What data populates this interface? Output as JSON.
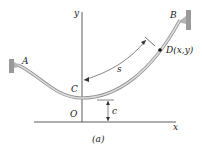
{
  "figure": {
    "caption": "(a)",
    "labels": {
      "A": "A",
      "B": "B",
      "C": "C",
      "O": "O",
      "D": "D(x,y)",
      "s": "s",
      "c": "c",
      "x_axis": "x",
      "y_axis": "y"
    },
    "colors": {
      "cable": "#bfbfbf",
      "cable_edge": "#8c8c8c",
      "support": "#9a9a9a",
      "axis": "#333333"
    }
  }
}
